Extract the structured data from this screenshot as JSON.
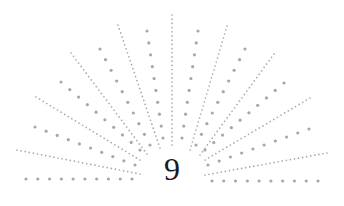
{
  "numeral": "9",
  "colors": {
    "dots": "#a8a8a8",
    "numeral": "#1a1a1a",
    "background": "#ffffff"
  },
  "rays": [
    {
      "type": "big",
      "x1": 26,
      "y1": 179,
      "x2": 132,
      "y2": 179
    },
    {
      "type": "small",
      "x1": 17,
      "y1": 150,
      "x2": 140,
      "y2": 174
    },
    {
      "type": "big",
      "x1": 35,
      "y1": 127,
      "x2": 135,
      "y2": 165
    },
    {
      "type": "small",
      "x1": 36,
      "y1": 97,
      "x2": 140,
      "y2": 160
    },
    {
      "type": "big",
      "x1": 61,
      "y1": 82,
      "x2": 140,
      "y2": 150
    },
    {
      "type": "small",
      "x1": 71,
      "y1": 53,
      "x2": 147,
      "y2": 154
    },
    {
      "type": "big",
      "x1": 100,
      "y1": 49,
      "x2": 150,
      "y2": 145
    },
    {
      "type": "small",
      "x1": 118,
      "y1": 25,
      "x2": 160,
      "y2": 148
    },
    {
      "type": "big",
      "x1": 147,
      "y1": 31,
      "x2": 163,
      "y2": 138
    },
    {
      "type": "small",
      "x1": 172,
      "y1": 15,
      "x2": 172,
      "y2": 145
    },
    {
      "type": "big",
      "x1": 198,
      "y1": 31,
      "x2": 182,
      "y2": 138
    },
    {
      "type": "small",
      "x1": 227,
      "y1": 26,
      "x2": 190,
      "y2": 150
    },
    {
      "type": "big",
      "x1": 245,
      "y1": 49,
      "x2": 196,
      "y2": 145
    },
    {
      "type": "small",
      "x1": 274,
      "y1": 54,
      "x2": 200,
      "y2": 155
    },
    {
      "type": "big",
      "x1": 284,
      "y1": 83,
      "x2": 205,
      "y2": 150
    },
    {
      "type": "small",
      "x1": 310,
      "y1": 98,
      "x2": 205,
      "y2": 160
    },
    {
      "type": "big",
      "x1": 309,
      "y1": 129,
      "x2": 208,
      "y2": 165
    },
    {
      "type": "small",
      "x1": 327,
      "y1": 153,
      "x2": 205,
      "y2": 175
    },
    {
      "type": "big",
      "x1": 212,
      "y1": 181,
      "x2": 318,
      "y2": 181
    }
  ]
}
